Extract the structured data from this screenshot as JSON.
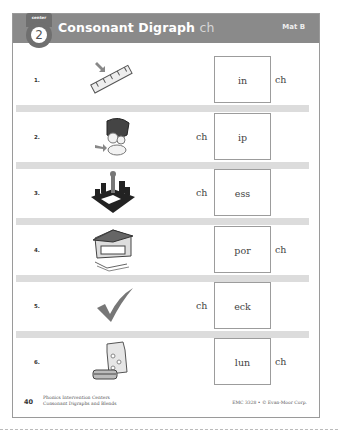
{
  "header": {
    "center_label": "center",
    "center_number": "2",
    "title": "Consonant Digraph",
    "digraph": "ch",
    "mat": "Mat B"
  },
  "rows": [
    {
      "number": "1.",
      "picture": "chin-ruler-icon",
      "word_part": "in",
      "ch_position": "right",
      "ch": "ch"
    },
    {
      "number": "2.",
      "picture": "chip-bag-icon",
      "word_part": "ip",
      "ch_position": "left",
      "ch": "ch"
    },
    {
      "number": "3.",
      "picture": "chess-icon",
      "word_part": "ess",
      "ch_position": "left",
      "ch": "ch"
    },
    {
      "number": "4.",
      "picture": "porch-house-icon",
      "word_part": "por",
      "ch_position": "right",
      "ch": "ch"
    },
    {
      "number": "5.",
      "picture": "check-mark-icon",
      "word_part": "eck",
      "ch_position": "left",
      "ch": "ch"
    },
    {
      "number": "6.",
      "picture": "lunch-bag-icon",
      "word_part": "lun",
      "ch_position": "right",
      "ch": "ch"
    }
  ],
  "footer": {
    "page_number": "40",
    "book_title": "Phonics Intervention Centers",
    "book_subtitle": "Consonant Digraphs and Blends",
    "copyright": "EMC 3328 • © Evan-Moor Corp."
  }
}
